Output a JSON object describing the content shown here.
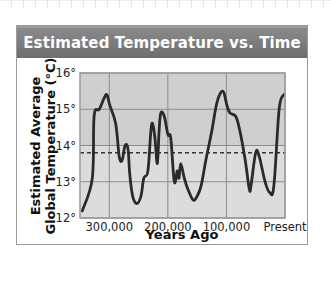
{
  "chart_data": {
    "type": "line",
    "title": "Estimated Temperature vs. Time",
    "xlabel": "Years Ago",
    "ylabel": "Estimated Average Global Temperature (°C)",
    "ylabel_lines": [
      "Estimated Average",
      "Global Temperature (°C)"
    ],
    "xlim": [
      350000,
      0
    ],
    "ylim": [
      12,
      16
    ],
    "x_ticks": [
      {
        "value": 300000,
        "label": "300,000"
      },
      {
        "value": 200000,
        "label": "200,000"
      },
      {
        "value": 100000,
        "label": "100,000"
      },
      {
        "value": 0,
        "label": "Present"
      }
    ],
    "y_ticks": [
      {
        "value": 12,
        "label": "12°"
      },
      {
        "value": 13,
        "label": "13°"
      },
      {
        "value": 14,
        "label": "14°"
      },
      {
        "value": 15,
        "label": "15°"
      },
      {
        "value": 16,
        "label": "16°"
      }
    ],
    "grid": true,
    "reference_line": {
      "value": 13.8,
      "style": "dashed",
      "label": "average"
    },
    "shading_split": 14,
    "colors": {
      "header": "#7a7a7a",
      "plot_upper": "#cfcfcf",
      "plot_lower": "#dcdcdc",
      "line": "#2a2a2a",
      "grid": "#8c8c8c"
    },
    "series": [
      {
        "name": "Estimated temperature",
        "x": [
          346000,
          329000,
          326000,
          317000,
          309000,
          304000,
          299000,
          289000,
          283000,
          278000,
          273000,
          268000,
          265000,
          260000,
          253000,
          246000,
          241000,
          234000,
          229000,
          226000,
          222000,
          218000,
          215000,
          212000,
          206000,
          200000,
          195000,
          189000,
          184000,
          181000,
          178000,
          172000,
          166000,
          157000,
          150000,
          143000,
          135000,
          125000,
          116000,
          106000,
          99000,
          94000,
          84000,
          77000,
          68000,
          61000,
          58000,
          50000,
          44000,
          34000,
          26000,
          19000,
          10000,
          2000
        ],
        "y": [
          12.2,
          13.1,
          14.8,
          15.0,
          15.3,
          15.4,
          15.1,
          14.6,
          13.7,
          13.6,
          14.0,
          13.9,
          13.2,
          12.6,
          12.4,
          12.6,
          13.1,
          13.3,
          14.4,
          14.6,
          14.2,
          13.5,
          14.4,
          14.9,
          14.8,
          14.3,
          14.2,
          13.0,
          13.3,
          13.1,
          13.5,
          13.1,
          12.8,
          12.5,
          12.6,
          12.9,
          13.6,
          14.4,
          15.2,
          15.5,
          15.1,
          14.9,
          14.8,
          14.4,
          13.6,
          12.8,
          12.9,
          13.8,
          13.7,
          13.0,
          12.7,
          12.9,
          15.0,
          15.4
        ]
      }
    ]
  }
}
